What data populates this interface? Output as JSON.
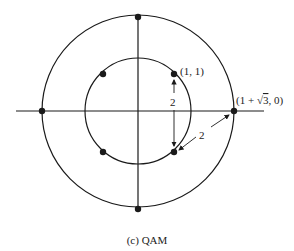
{
  "diagram": {
    "caption": "(c) QAM",
    "labels": {
      "inner_point": "(1, 1)",
      "outer_point_prefix": "(1 + ",
      "outer_point_sqrt": "3",
      "outer_point_suffix": ", 0)",
      "vertical_distance": "2",
      "diagonal_distance": "2"
    },
    "inner_circle": {
      "radius": "√2",
      "points": [
        "(1, 1)",
        "(-1, 1)",
        "(-1, -1)",
        "(1, -1)"
      ]
    },
    "outer_circle": {
      "radius": "1 + √3",
      "points": [
        "(1 + √3, 0)",
        "(0, 1 + √3)",
        "(-1 - √3, 0)",
        "(0, -1 - √3)"
      ]
    },
    "colors": {
      "stroke": "#1a1a1a",
      "background": "#ffffff"
    }
  }
}
